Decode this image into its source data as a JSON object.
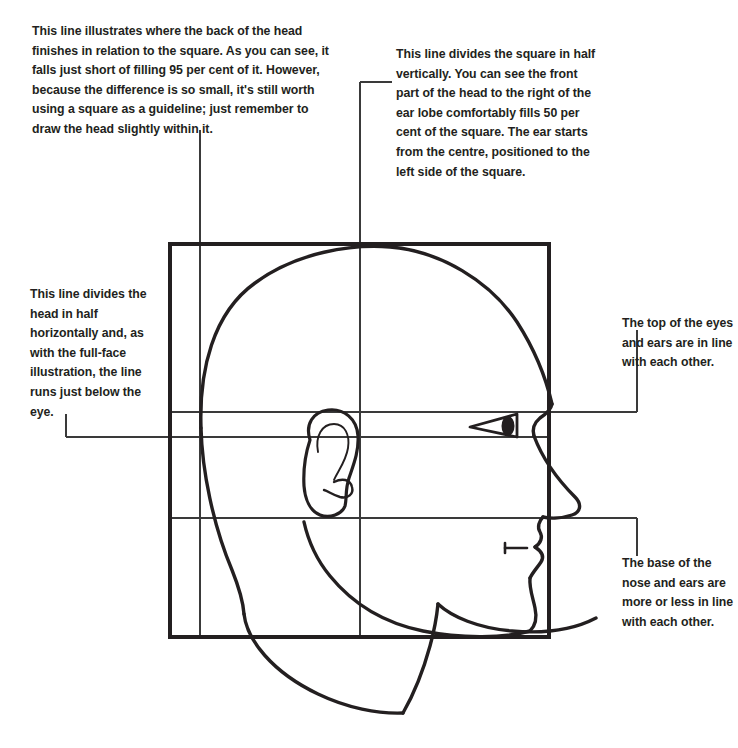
{
  "page": {
    "width": 738,
    "height": 748,
    "background_color": "#ffffff",
    "ink_color": "#231f20",
    "guide_color": "#3a3a3a"
  },
  "annotations": {
    "top_left": {
      "name": "back-of-head-note",
      "text": "This line illustrates where the back of the head finishes in relation to the square. As you can see, it falls just short of filling 95 per cent of it. However, because the difference is so small, it's still worth using a square as a guideline; just remember to draw the head slightly within it."
    },
    "top_right": {
      "name": "vertical-halves-note",
      "text": "This line divides the square in half vertically. You can see the front part of the head to the right of the ear lobe comfortably fills 50 per cent of the square. The ear starts from the centre, positioned to the left side of the square."
    },
    "mid_left": {
      "name": "horizontal-halves-note",
      "text": "This line divides the head in half horizontally and, as with the full-face illustration, the line runs just below the eye."
    },
    "mid_right": {
      "name": "eye-ear-top-note",
      "text": "The top of the eyes and ears are in line with each other."
    },
    "low_right": {
      "name": "nose-ear-base-note",
      "text": "The base of the nose and ears are more or less in line with each other."
    }
  },
  "figure": {
    "square": {
      "x": 170,
      "y": 244,
      "width": 379,
      "height": 393
    },
    "guides": {
      "back_of_head_vertical_x": 200,
      "centre_vertical_x": 360,
      "centre_vertical_top_y": 82,
      "eye_ear_top_horizontal_y": 412,
      "half_height_horizontal_y": 437,
      "nose_ear_base_horizontal_y": 518
    },
    "leaders": {
      "top_left_x": 200,
      "top_left_top_y": 130,
      "centre_tick_y": 82,
      "left_leader_x": 66,
      "left_leader_y": 437,
      "right_leader_x": 637,
      "right_leader_upper_y": 412,
      "right_leader_lower_y": 518
    },
    "features": {
      "ear": {
        "x": 300,
        "y": 410,
        "width": 60,
        "height": 108
      },
      "eye": {
        "x": 470,
        "y": 414,
        "width": 52,
        "height": 22
      },
      "nose_tip": {
        "x": 578,
        "y": 500
      },
      "mouth_tick": {
        "x1": 505,
        "x2": 527,
        "y": 548
      },
      "chin": {
        "x": 530,
        "y": 620
      }
    }
  }
}
